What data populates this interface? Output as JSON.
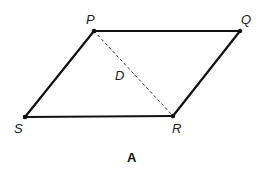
{
  "figure": {
    "caption": "A",
    "shape": "parallelogram",
    "colors": {
      "stroke": "#111111",
      "dashed": "#333333",
      "background": "#ffffff"
    },
    "vertices": {
      "P": {
        "label": "P",
        "x": 94,
        "y": 31
      },
      "Q": {
        "label": "Q",
        "x": 240,
        "y": 31
      },
      "R": {
        "label": "R",
        "x": 173,
        "y": 116
      },
      "S": {
        "label": "S",
        "x": 25,
        "y": 117
      }
    },
    "diagonal": {
      "from": "P",
      "to": "R",
      "style": "dashed",
      "label": "D"
    }
  }
}
